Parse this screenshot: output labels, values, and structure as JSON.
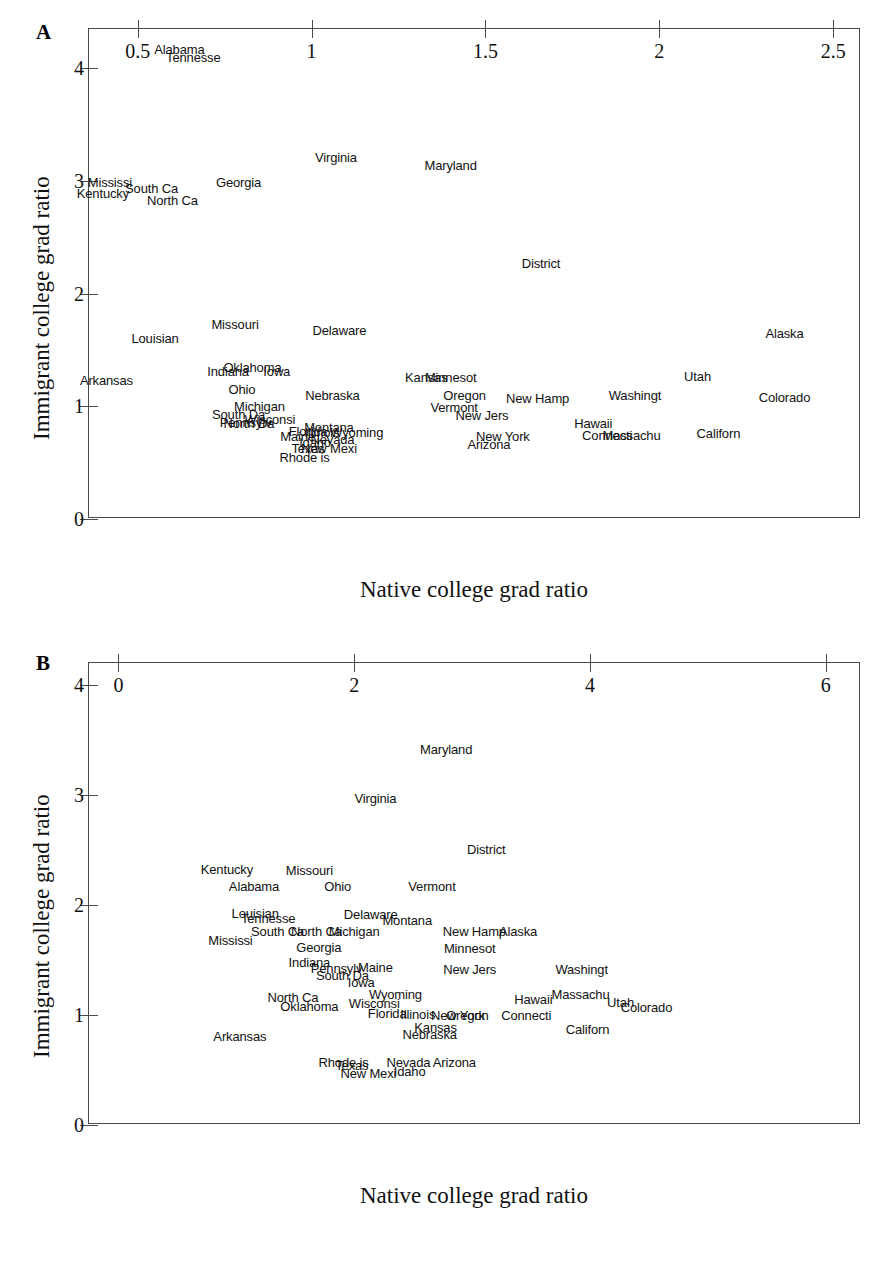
{
  "figure": {
    "background": "#ffffff",
    "axis_color": "#4a4a4a",
    "text_color": "#111111"
  },
  "panels": [
    {
      "letter": "A",
      "chart_data": {
        "type": "scatter",
        "title": "",
        "xlabel": "Native college grad ratio",
        "ylabel": "Immigrant college grad ratio",
        "xlim": [
          0.36,
          2.58
        ],
        "ylim": [
          0,
          4.35
        ],
        "xticks": [
          "0.5",
          "1",
          "1.5",
          "2",
          "2.5"
        ],
        "xtick_values": [
          0.5,
          1,
          1.5,
          2,
          2.5
        ],
        "yticks": [
          "0",
          "1",
          "2",
          "3",
          "4"
        ],
        "ytick_values": [
          0,
          1,
          2,
          3,
          4
        ],
        "grid": false,
        "legend": "none",
        "marker": "text-label",
        "points": [
          {
            "label": "Alabama",
            "x": 0.62,
            "y": 4.17
          },
          {
            "label": "Tennesse",
            "x": 0.66,
            "y": 4.1
          },
          {
            "label": "Virginia",
            "x": 1.07,
            "y": 3.21
          },
          {
            "label": "Maryland",
            "x": 1.4,
            "y": 3.14
          },
          {
            "label": "Mississi",
            "x": 0.42,
            "y": 2.99
          },
          {
            "label": "Georgia",
            "x": 0.79,
            "y": 2.99
          },
          {
            "label": "South Ca",
            "x": 0.54,
            "y": 2.94
          },
          {
            "label": "Kentucky",
            "x": 0.4,
            "y": 2.89
          },
          {
            "label": "North Ca",
            "x": 0.6,
            "y": 2.83
          },
          {
            "label": "District",
            "x": 1.66,
            "y": 2.27
          },
          {
            "label": "Missouri",
            "x": 0.78,
            "y": 1.73
          },
          {
            "label": "Delaware",
            "x": 1.08,
            "y": 1.68
          },
          {
            "label": "Alaska",
            "x": 2.36,
            "y": 1.65
          },
          {
            "label": "Louisian",
            "x": 0.55,
            "y": 1.61
          },
          {
            "label": "Oklahoma",
            "x": 0.83,
            "y": 1.35
          },
          {
            "label": "Indiana",
            "x": 0.76,
            "y": 1.31
          },
          {
            "label": "Iowa",
            "x": 0.9,
            "y": 1.31
          },
          {
            "label": "Kansas",
            "x": 1.33,
            "y": 1.26
          },
          {
            "label": "Minnesot",
            "x": 1.4,
            "y": 1.26
          },
          {
            "label": "Utah",
            "x": 2.11,
            "y": 1.27
          },
          {
            "label": "Arkansas",
            "x": 0.41,
            "y": 1.23
          },
          {
            "label": "Ohio",
            "x": 0.8,
            "y": 1.15
          },
          {
            "label": "Nebraska",
            "x": 1.06,
            "y": 1.1
          },
          {
            "label": "Oregon",
            "x": 1.44,
            "y": 1.1
          },
          {
            "label": "Washingt",
            "x": 1.93,
            "y": 1.1
          },
          {
            "label": "Colorado",
            "x": 2.36,
            "y": 1.08
          },
          {
            "label": "New Hamp",
            "x": 1.65,
            "y": 1.07
          },
          {
            "label": "Michigan",
            "x": 0.85,
            "y": 1.0
          },
          {
            "label": "Vermont",
            "x": 1.41,
            "y": 0.99
          },
          {
            "label": "South Da",
            "x": 0.79,
            "y": 0.93
          },
          {
            "label": "New Jers",
            "x": 1.49,
            "y": 0.92
          },
          {
            "label": "Wisconsi",
            "x": 0.88,
            "y": 0.89
          },
          {
            "label": "Pennsylv",
            "x": 0.81,
            "y": 0.86
          },
          {
            "label": "North Da",
            "x": 0.82,
            "y": 0.85
          },
          {
            "label": "Hawaii",
            "x": 1.81,
            "y": 0.85
          },
          {
            "label": "Montana",
            "x": 1.05,
            "y": 0.82
          },
          {
            "label": "Wyoming",
            "x": 1.13,
            "y": 0.77
          },
          {
            "label": "Florida",
            "x": 0.99,
            "y": 0.78
          },
          {
            "label": "Illinois",
            "x": 1.03,
            "y": 0.77
          },
          {
            "label": "Connecti",
            "x": 1.85,
            "y": 0.75
          },
          {
            "label": "Massachu",
            "x": 1.92,
            "y": 0.75
          },
          {
            "label": "Californ",
            "x": 2.17,
            "y": 0.76
          },
          {
            "label": "Maine",
            "x": 0.96,
            "y": 0.74
          },
          {
            "label": "New York",
            "x": 1.55,
            "y": 0.74
          },
          {
            "label": "Nevada",
            "x": 1.06,
            "y": 0.71
          },
          {
            "label": "Idaho",
            "x": 1.01,
            "y": 0.68
          },
          {
            "label": "Arizona",
            "x": 1.51,
            "y": 0.67
          },
          {
            "label": "Texas",
            "x": 0.99,
            "y": 0.63
          },
          {
            "label": "New Mexi",
            "x": 1.05,
            "y": 0.63
          },
          {
            "label": "Rhode is",
            "x": 0.98,
            "y": 0.55
          }
        ]
      }
    },
    {
      "letter": "B",
      "chart_data": {
        "type": "scatter",
        "title": "",
        "xlabel": "Native college grad ratio",
        "ylabel": "Immigrant college grad ratio",
        "xlim": [
          -0.25,
          6.3
        ],
        "ylim": [
          0,
          4.2
        ],
        "xticks": [
          "0",
          "2",
          "4",
          "6"
        ],
        "xtick_values": [
          0,
          2,
          4,
          6
        ],
        "yticks": [
          "0",
          "1",
          "2",
          "3",
          "4"
        ],
        "ytick_values": [
          0,
          1,
          2,
          3,
          4
        ],
        "grid": false,
        "legend": "none",
        "marker": "text-label",
        "points": [
          {
            "label": "Maryland",
            "x": 2.78,
            "y": 3.42
          },
          {
            "label": "Virginia",
            "x": 2.18,
            "y": 2.97
          },
          {
            "label": "District",
            "x": 3.12,
            "y": 2.51
          },
          {
            "label": "Kentucky",
            "x": 0.92,
            "y": 2.33
          },
          {
            "label": "Missouri",
            "x": 1.62,
            "y": 2.32
          },
          {
            "label": "Alabama",
            "x": 1.15,
            "y": 2.17
          },
          {
            "label": "Ohio",
            "x": 1.86,
            "y": 2.17
          },
          {
            "label": "Vermont",
            "x": 2.66,
            "y": 2.17
          },
          {
            "label": "Louisian",
            "x": 1.16,
            "y": 1.93
          },
          {
            "label": "Delaware",
            "x": 2.14,
            "y": 1.92
          },
          {
            "label": "Tennesse",
            "x": 1.27,
            "y": 1.88
          },
          {
            "label": "Montana",
            "x": 2.45,
            "y": 1.86
          },
          {
            "label": "South Ca",
            "x": 1.35,
            "y": 1.76
          },
          {
            "label": "North Ca",
            "x": 1.68,
            "y": 1.76
          },
          {
            "label": "Michigan",
            "x": 2.0,
            "y": 1.76
          },
          {
            "label": "New Hamp",
            "x": 3.02,
            "y": 1.76
          },
          {
            "label": "Alaska",
            "x": 3.39,
            "y": 1.76
          },
          {
            "label": "Mississi",
            "x": 0.95,
            "y": 1.68
          },
          {
            "label": "Georgia",
            "x": 1.7,
            "y": 1.62
          },
          {
            "label": "Minnesot",
            "x": 2.98,
            "y": 1.61
          },
          {
            "label": "Indiana",
            "x": 1.62,
            "y": 1.48
          },
          {
            "label": "Pennsylv",
            "x": 1.85,
            "y": 1.43
          },
          {
            "label": "Maine",
            "x": 2.18,
            "y": 1.44
          },
          {
            "label": "New Jers",
            "x": 2.98,
            "y": 1.42
          },
          {
            "label": "Washingt",
            "x": 3.93,
            "y": 1.42
          },
          {
            "label": "South Da",
            "x": 1.9,
            "y": 1.36
          },
          {
            "label": "Iowa",
            "x": 2.06,
            "y": 1.3
          },
          {
            "label": "Wyoming",
            "x": 2.35,
            "y": 1.19
          },
          {
            "label": "Massachu",
            "x": 3.92,
            "y": 1.19
          },
          {
            "label": "North Ca",
            "x": 1.48,
            "y": 1.16
          },
          {
            "label": "Hawaii",
            "x": 3.52,
            "y": 1.15
          },
          {
            "label": "Wisconsi",
            "x": 2.17,
            "y": 1.11
          },
          {
            "label": "Utah",
            "x": 4.26,
            "y": 1.12
          },
          {
            "label": "Oklahoma",
            "x": 1.62,
            "y": 1.08
          },
          {
            "label": "Colorado",
            "x": 4.48,
            "y": 1.07
          },
          {
            "label": "Florida",
            "x": 2.28,
            "y": 1.02
          },
          {
            "label": "Illinois",
            "x": 2.54,
            "y": 1.01
          },
          {
            "label": "New York",
            "x": 2.88,
            "y": 1.0
          },
          {
            "label": "Oregon",
            "x": 2.96,
            "y": 1.0
          },
          {
            "label": "Connecti",
            "x": 3.46,
            "y": 1.0
          },
          {
            "label": "Kansas",
            "x": 2.69,
            "y": 0.89
          },
          {
            "label": "Californ",
            "x": 3.98,
            "y": 0.87
          },
          {
            "label": "Nebraska",
            "x": 2.64,
            "y": 0.83
          },
          {
            "label": "Arkansas",
            "x": 1.03,
            "y": 0.81
          },
          {
            "label": "Rhode is",
            "x": 1.91,
            "y": 0.57
          },
          {
            "label": "Texas",
            "x": 1.98,
            "y": 0.55
          },
          {
            "label": "Nevada",
            "x": 2.46,
            "y": 0.57
          },
          {
            "label": "Arizona",
            "x": 2.85,
            "y": 0.57
          },
          {
            "label": "Idaho",
            "x": 2.47,
            "y": 0.49
          },
          {
            "label": "New Mexi",
            "x": 2.12,
            "y": 0.47
          }
        ]
      }
    }
  ]
}
